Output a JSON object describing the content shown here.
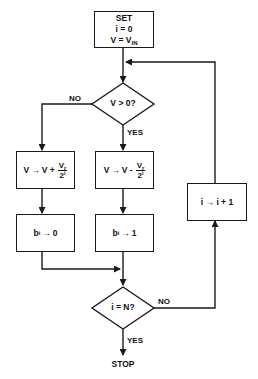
{
  "diagram": {
    "type": "flowchart",
    "nodes": {
      "start": {
        "line1": "SET",
        "line2": "i = 0",
        "line3_main": "V = V",
        "line3_sub": "IN"
      },
      "decision_sign": {
        "label": "V > 0?"
      },
      "update_plus": {
        "lhs": "V",
        "arrow": "→",
        "rhs": "V +",
        "num_main": "V",
        "num_sub": "r",
        "den_main": "2",
        "den_sup": "i"
      },
      "update_minus": {
        "lhs": "V",
        "arrow": "→",
        "rhs": "V -",
        "num_main": "V",
        "num_sub": "r",
        "den_main": "2",
        "den_sup": "i"
      },
      "bit_zero": {
        "b": "b",
        "b_sub": "i",
        "arrow": "→",
        "value": "0"
      },
      "bit_one": {
        "b": "b",
        "b_sub": "i",
        "arrow": "→",
        "value": "1"
      },
      "increment": {
        "label": "i → i + 1"
      },
      "decision_done": {
        "label": "i = N?"
      },
      "end": {
        "label": "STOP"
      }
    },
    "edge_labels": {
      "sign_no": "NO",
      "sign_yes": "YES",
      "done_no": "NO",
      "done_yes": "YES"
    },
    "colors": {
      "stroke": "#1a1a1a",
      "background": "#ffffff",
      "text": "#111111"
    }
  }
}
